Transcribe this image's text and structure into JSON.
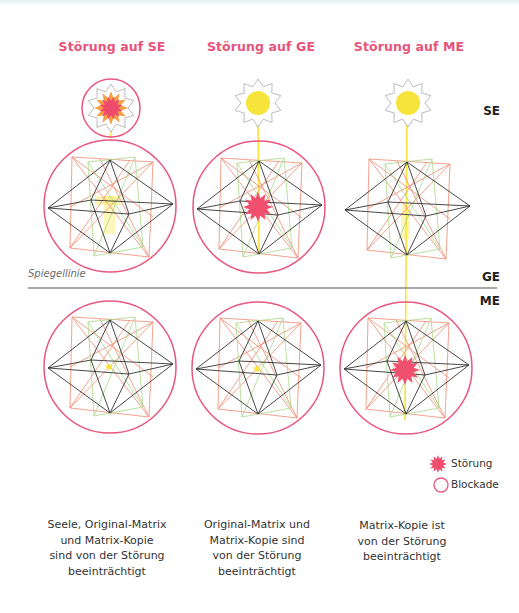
{
  "headers": {
    "col1": "Störung auf SE",
    "col2": "Störung auf GE",
    "col3": "Störung auf ME"
  },
  "levels": {
    "se": "SE",
    "ge": "GE",
    "me": "ME"
  },
  "mirror_line": {
    "label": "Spiegellinie"
  },
  "legend": {
    "disturbance": "Störung",
    "blockade": "Blockade"
  },
  "captions": {
    "col1": [
      "Seele, Original-Matrix",
      "und Matrix-Kopie",
      "sind von der Störung",
      "beeinträchtigt"
    ],
    "col2": [
      "Original-Matrix und",
      "Matrix-Kopie sind",
      "von der Störung",
      "beeinträchtigt"
    ],
    "col3": [
      "Matrix-Kopie ist",
      "von der Störung",
      "beeinträchtigt"
    ]
  },
  "colors": {
    "accent_pink": "#e9537a",
    "disturbance": "#f0506e",
    "blockade_ring": "#e8577e",
    "sun_yellow": "#f7e43a",
    "octahedron": "#333333",
    "matrix_red": "#f08a70",
    "matrix_green": "#a9d88a"
  }
}
